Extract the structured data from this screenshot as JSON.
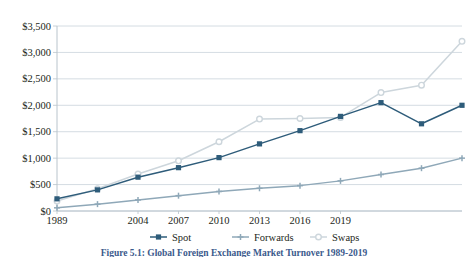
{
  "figure": {
    "caption": "Figure 5.1: Global Foreign Exchange Market Turnover 1989-2019",
    "caption_color": "#3b5a8c"
  },
  "chart_data": {
    "type": "line",
    "title": "Global Foreign Exchange Market Turnover 1989-2019",
    "xlabel": "",
    "ylabel": "",
    "ylim": [
      0,
      3500
    ],
    "ytick_values": [
      0,
      500,
      1000,
      1500,
      2000,
      2500,
      3000,
      3500
    ],
    "ytick_labels": [
      "$0",
      "$500",
      "$1,000",
      "$1,500",
      "$2,000",
      "$2,500",
      "$3,000",
      "$3,500"
    ],
    "x": [
      1989,
      1992,
      1995,
      1998,
      2001,
      2004,
      2007,
      2010,
      2013,
      2016,
      2019
    ],
    "xtick_labels": [
      "1989",
      "2004",
      "2007",
      "2010",
      "2013",
      "2016",
      "2019"
    ],
    "xtick_positions": [
      1989,
      1995,
      1998,
      2001,
      2004,
      2007,
      2010
    ],
    "grid": true,
    "legend_position": "bottom",
    "series": [
      {
        "name": "Spot",
        "color": "#2e5c7a",
        "marker": "square",
        "values": [
          230,
          400,
          640,
          820,
          1010,
          1270,
          1520,
          1790,
          2050,
          1650,
          2000
        ]
      },
      {
        "name": "Forwards",
        "color": "#8fa8b8",
        "marker": "cross",
        "values": [
          60,
          130,
          210,
          290,
          370,
          430,
          480,
          570,
          690,
          810,
          1000
        ]
      },
      {
        "name": "Swaps",
        "color": "#cdd6dc",
        "marker": "circle",
        "values": [
          190,
          420,
          700,
          950,
          1310,
          1740,
          1750,
          1770,
          2240,
          2380,
          3210
        ]
      }
    ]
  },
  "legend": {
    "items": [
      {
        "label": "Spot",
        "color": "#2e5c7a",
        "marker": "square"
      },
      {
        "label": "Forwards",
        "color": "#8fa8b8",
        "marker": "cross"
      },
      {
        "label": "Swaps",
        "color": "#cdd6dc",
        "marker": "circle"
      }
    ]
  }
}
